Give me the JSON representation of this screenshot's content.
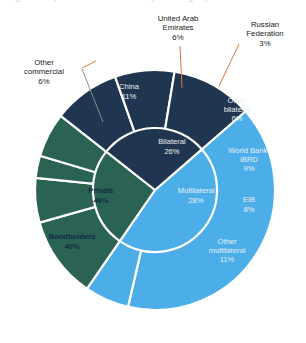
{
  "figure": {
    "background": "#ffffff",
    "clipped_heading": "Figure: Composition of external debt by creditor group"
  },
  "chart_data": {
    "type": "pie",
    "variant": "sunburst",
    "title": "",
    "subtitle": "",
    "xlabel": "",
    "ylabel": "",
    "grid": false,
    "legend": "none",
    "value_unit": "%",
    "center": {
      "cx": 155,
      "cy": 190
    },
    "radii": {
      "inner_ring": 62,
      "outer_ring": 120
    },
    "start_angle_deg": -41,
    "direction": "clockwise",
    "rings": [
      {
        "name": "inner",
        "level": 1,
        "slices": [
          {
            "label": "Private",
            "value": 46,
            "display": "46%",
            "color": "#4BAEE8",
            "text_color": "#102c44",
            "label_x": 101,
            "label_y": 196
          },
          {
            "label": "Bilateral",
            "value": 26,
            "display": "26%",
            "color": "#2A6354",
            "text_color": "#e9f2ef",
            "label_x": 172,
            "label_y": 147
          },
          {
            "label": "Multilateral",
            "value": 28,
            "display": "28%",
            "color": "#1F3550",
            "text_color": "#e7eef5",
            "label_x": 196,
            "label_y": 196
          }
        ]
      },
      {
        "name": "outer",
        "level": 2,
        "slices": [
          {
            "label": "Bondholders",
            "value": 40,
            "display": "40%",
            "parent": "Private",
            "color": "#4BAEE8",
            "text_color": "#102c44",
            "label_x": 72,
            "label_y": 242,
            "callout": false
          },
          {
            "label": "Other commercial",
            "value": 6,
            "display": "6%",
            "parent": "Private",
            "color": "#4BAEE8",
            "text_color": "#102c44",
            "callout": true
          },
          {
            "label": "China",
            "value": 11,
            "display": "11%",
            "parent": "Bilateral",
            "color": "#2A6354",
            "text_color": "#e9f2ef",
            "label_x": 129,
            "label_y": 92,
            "callout": false
          },
          {
            "label": "United Arab Emirates",
            "value": 6,
            "display": "6%",
            "parent": "Bilateral",
            "color": "#2A6354",
            "text_color": "#e9f2ef",
            "callout": true
          },
          {
            "label": "Russian Federation",
            "value": 3,
            "display": "3%",
            "parent": "Bilateral",
            "color": "#2A6354",
            "text_color": "#e9f2ef",
            "callout": true
          },
          {
            "label": "Other bilateral",
            "value": 6,
            "display": "6%",
            "parent": "Bilateral",
            "color": "#2A6354",
            "text_color": "#e9f2ef",
            "label_x": 237,
            "label_y": 110,
            "callout": false
          },
          {
            "label": "World Bank-IBRD",
            "value": 9,
            "display": "9%",
            "parent": "Multilateral",
            "color": "#1F3550",
            "text_color": "#e7eef5",
            "label_x": 249,
            "label_y": 160,
            "callout": false
          },
          {
            "label": "EIB",
            "value": 8,
            "display": "8%",
            "parent": "Multilateral",
            "color": "#1F3550",
            "text_color": "#e7eef5",
            "label_x": 249,
            "label_y": 205,
            "callout": false
          },
          {
            "label": "Other multilateral",
            "value": 11,
            "display": "11%",
            "parent": "Multilateral",
            "color": "#1F3550",
            "text_color": "#e7eef5",
            "label_x": 227,
            "label_y": 251,
            "callout": false
          }
        ]
      }
    ],
    "callouts": [
      {
        "name": "other-commercial",
        "lines": [
          "Other",
          "commercial",
          "6%"
        ],
        "box_left": 8,
        "box_top": 58,
        "box_width": 72,
        "leader_orange": {
          "x1": 82,
          "y1": 68,
          "x2": 96,
          "y2": 61
        },
        "leader_gray": {
          "x1": 82,
          "y1": 69,
          "x2": 103,
          "y2": 122
        }
      },
      {
        "name": "united-arab-emirates",
        "lines": [
          "United Arab",
          "Emirates",
          "6%"
        ],
        "box_left": 140,
        "box_top": 14,
        "box_width": 76,
        "leader_orange": {
          "x1": 180,
          "y1": 46,
          "x2": 182,
          "y2": 88
        }
      },
      {
        "name": "russian-federation",
        "lines": [
          "Russian",
          "Federation",
          "3%"
        ],
        "box_left": 232,
        "box_top": 20,
        "box_width": 66,
        "leader_orange": {
          "x1": 239,
          "y1": 44,
          "x2": 219,
          "y2": 86
        }
      }
    ],
    "colors": {
      "private_blue": "#4BAEE8",
      "bilateral_green": "#2A6354",
      "multilateral_navy": "#1F3550",
      "separator": "#ffffff",
      "callout_leader_orange": "#D9773F",
      "callout_leader_gray": "#8d8d8d",
      "label_text_dark": "#20201f"
    }
  }
}
